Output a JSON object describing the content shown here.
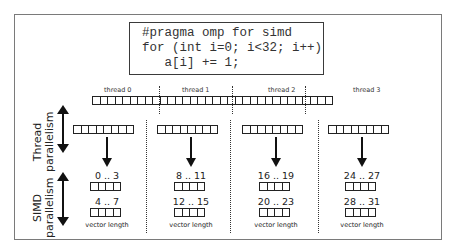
{
  "code": {
    "lines": [
      "#pragma omp for simd",
      "for (int i=0; i<32; i++)",
      "   a[i] += 1;"
    ]
  },
  "global_array": {
    "total_cells": 32,
    "thread_labels": [
      "thread 0",
      "thread 1",
      "thread 2",
      "thread 3"
    ]
  },
  "side_labels": {
    "thread": [
      "Thread",
      "parallelism"
    ],
    "simd": [
      "SIMD",
      "parallelism"
    ]
  },
  "threads": [
    {
      "name": "thread 0",
      "vectors": [
        {
          "range": "0 .. 3"
        },
        {
          "range": "4 .. 7"
        }
      ],
      "vector_length_label": "vector length"
    },
    {
      "name": "thread 1",
      "vectors": [
        {
          "range": "8 .. 11"
        },
        {
          "range": "12 .. 15"
        }
      ],
      "vector_length_label": "vector length"
    },
    {
      "name": "thread 2",
      "vectors": [
        {
          "range": "16 .. 19"
        },
        {
          "range": "20 .. 23"
        }
      ],
      "vector_length_label": "vector length"
    },
    {
      "name": "thread 3",
      "vectors": [
        {
          "range": "24 .. 27"
        },
        {
          "range": "28 .. 31"
        }
      ],
      "vector_length_label": "vector length"
    }
  ],
  "cells_per_thread": 8,
  "simd_width": 4
}
